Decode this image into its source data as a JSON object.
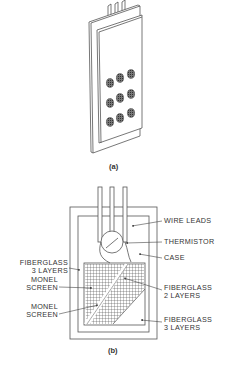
{
  "figure_a": {
    "caption": "(a)",
    "screen_dots": 9
  },
  "figure_b": {
    "caption": "(b)",
    "labels": {
      "wire_leads": "WIRE LEADS",
      "thermistor": "THERMISTOR",
      "case": "CASE",
      "fiberglass_3_top_l1": "FIBERGLASS",
      "fiberglass_3_top_l2": "3 LAYERS",
      "monel_screen_1_l1": "MONEL",
      "monel_screen_1_l2": "SCREEN",
      "monel_screen_2_l1": "MONEL",
      "monel_screen_2_l2": "SCREEN",
      "fiberglass_2_l1": "FIBERGLASS",
      "fiberglass_2_l2": "2 LAYERS",
      "fiberglass_3_bot_l1": "FIBERGLASS",
      "fiberglass_3_bot_l2": "3 LAYERS"
    }
  },
  "colors": {
    "line": "#555555",
    "fill_dot": "#444444",
    "text": "#333333"
  }
}
